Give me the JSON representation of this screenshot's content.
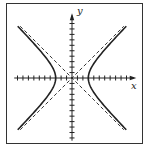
{
  "chart_data": {
    "type": "line",
    "title": "",
    "xlabel": "x",
    "ylabel": "y",
    "xlim": [
      -10,
      11.5
    ],
    "ylim": [
      -11.5,
      11.5
    ],
    "grid": false,
    "legend": null,
    "tick_spacing": 1,
    "tick_labels": false,
    "equation": "x^2/9 - y^2/9 = 1",
    "series": [
      {
        "name": "hyperbola-right-branch",
        "style": "solid",
        "function": "x = 3*sqrt(1 + y^2/9)",
        "vertex": [
          3,
          0
        ],
        "y_range": [
          -9.5,
          9.5
        ]
      },
      {
        "name": "hyperbola-left-branch",
        "style": "solid",
        "function": "x = -3*sqrt(1 + y^2/9)",
        "vertex": [
          -3,
          0
        ],
        "y_range": [
          -9.5,
          9.5
        ]
      },
      {
        "name": "asymptote-positive",
        "style": "dashed",
        "function": "y = x",
        "x_range": [
          -9.5,
          9.5
        ]
      },
      {
        "name": "asymptote-negative",
        "style": "dashed",
        "function": "y = -x",
        "x_range": [
          -9.5,
          9.5
        ]
      }
    ]
  },
  "labels": {
    "x_axis": "x",
    "y_axis": "y"
  },
  "colors": {
    "stroke": "#222222",
    "frame": "#333333",
    "background": "#ffffff"
  }
}
